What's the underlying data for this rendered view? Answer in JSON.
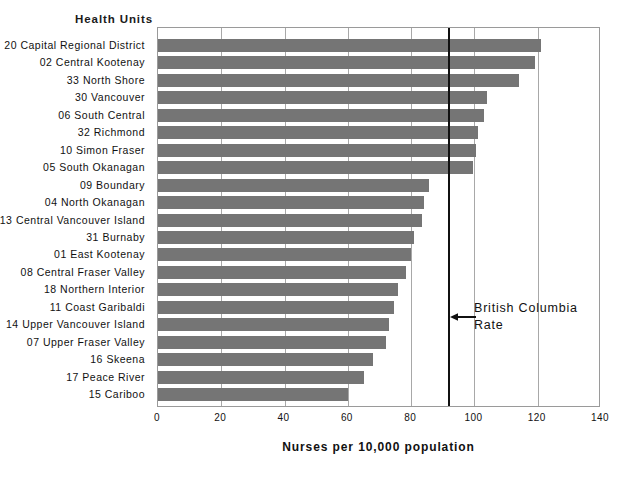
{
  "chart_header": "Health Units",
  "chart_data": {
    "type": "bar",
    "orientation": "horizontal",
    "title": "",
    "xlabel": "Nurses per 10,000 population",
    "ylabel": "Health Units",
    "xlim": [
      0,
      140
    ],
    "xticks": [
      0,
      20,
      40,
      60,
      80,
      100,
      120,
      140
    ],
    "xtick_labels": [
      "0",
      "20",
      "40",
      "60",
      "80",
      "100",
      "120",
      "140"
    ],
    "grid": true,
    "legend": "none",
    "bar_color": "#757575",
    "categories": [
      "20 Capital Regional District",
      "02 Central Kootenay",
      "33 North Shore",
      "30 Vancouver",
      "06 South Central",
      "32 Richmond",
      "10 Simon Fraser",
      "05 South Okanagan",
      "09 Boundary",
      "04 North Okanagan",
      "13 Central Vancouver Island",
      "31 Burnaby",
      "01 East Kootenay",
      "08 Central Fraser Valley",
      "18 Northern Interior",
      "11 Coast Garibaldi",
      "14 Upper Vancouver Island",
      "07 Upper Fraser Valley",
      "16 Skeena",
      "17 Peace River",
      "15 Cariboo"
    ],
    "values": [
      121,
      119,
      114,
      104,
      103,
      101,
      100.5,
      99.5,
      85.5,
      84,
      83.5,
      81,
      80,
      78.5,
      76,
      74.5,
      73,
      72,
      68,
      65,
      60
    ],
    "reference_line": {
      "label": "British Columbia Rate",
      "value": 92,
      "color": "#111111"
    }
  },
  "annotation": {
    "line1": "British  Columbia",
    "line2": "Rate"
  }
}
